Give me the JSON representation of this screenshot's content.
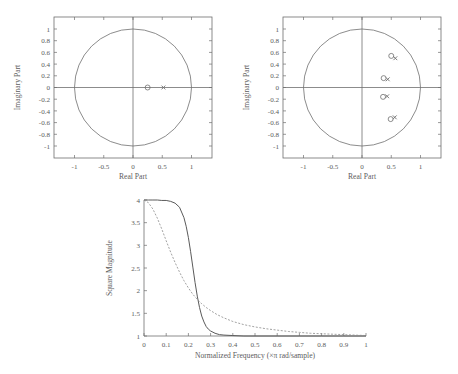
{
  "figure": {
    "background": "#ffffff",
    "ink_color": "#5d5d5d"
  },
  "panels": [
    {
      "id": "pole-zero-plot-1",
      "type": "pole-zero",
      "xlabel": "Real Part",
      "ylabel": "Imaginary Part",
      "xticks": [
        "-1",
        "-0.5",
        "0",
        "0.5",
        "1"
      ],
      "xtick_values": [
        -1,
        -0.5,
        0,
        0.5,
        1
      ],
      "yticks": [
        "1",
        "0.8",
        "0.6",
        "0.4",
        "0.2",
        "0",
        "-0.2",
        "-0.4",
        "-0.6",
        "-0.8",
        "-1"
      ],
      "ytick_values": [
        1,
        0.8,
        0.6,
        0.4,
        0.2,
        0,
        -0.2,
        -0.4,
        -0.6,
        -0.8,
        -1
      ],
      "xlim": [
        -1.35,
        1.35
      ],
      "ylim": [
        -1.12,
        1.12
      ],
      "unit_circle": true,
      "zeros": [
        [
          0.25,
          0.0
        ]
      ],
      "poles": [
        [
          0.52,
          0.0
        ]
      ]
    },
    {
      "id": "pole-zero-plot-2",
      "type": "pole-zero",
      "xlabel": "Real Part",
      "ylabel": "Imaginary Part",
      "xticks": [
        "-1",
        "-0.5",
        "0",
        "0.5",
        "1"
      ],
      "xtick_values": [
        -1,
        -0.5,
        0,
        0.5,
        1
      ],
      "yticks": [
        "1",
        "0.8",
        "0.6",
        "0.4",
        "0.2",
        "0",
        "-0.2",
        "-0.4",
        "-0.6",
        "-0.8",
        "-1"
      ],
      "ytick_values": [
        1,
        0.8,
        0.6,
        0.4,
        0.2,
        0,
        -0.2,
        -0.4,
        -0.6,
        -0.8,
        -1
      ],
      "xlim": [
        -1.35,
        1.35
      ],
      "ylim": [
        -1.12,
        1.12
      ],
      "unit_circle": true,
      "zeros": [
        [
          0.5,
          0.54
        ],
        [
          0.37,
          0.16
        ],
        [
          0.36,
          -0.16
        ],
        [
          0.49,
          -0.54
        ]
      ],
      "poles": [
        [
          0.57,
          0.5
        ],
        [
          0.44,
          0.14
        ],
        [
          0.43,
          -0.15
        ],
        [
          0.56,
          -0.51
        ]
      ]
    }
  ],
  "chart_data": {
    "type": "line",
    "title": "",
    "xlabel": "Normalized Frequency (×π rad/sample)",
    "ylabel": "Square Magnitude",
    "xlim": [
      0,
      1
    ],
    "ylim": [
      1,
      4
    ],
    "xticks": [
      "0",
      "0.1",
      "0.2",
      "0.3",
      "0.4",
      "0.5",
      "0.6",
      "0.7",
      "0.8",
      "0.9",
      "1"
    ],
    "xtick_values": [
      0,
      0.1,
      0.2,
      0.3,
      0.4,
      0.5,
      0.6,
      0.7,
      0.8,
      0.9,
      1
    ],
    "yticks": [
      "1",
      "1.5",
      "2",
      "2.5",
      "3",
      "3.5",
      "4"
    ],
    "ytick_values": [
      1,
      1.5,
      2,
      2.5,
      3,
      3.5,
      4
    ],
    "grid": false,
    "legend": "none",
    "series": [
      {
        "name": "high-order (solid)",
        "style": "solid",
        "x": [
          0.0,
          0.02,
          0.04,
          0.06,
          0.08,
          0.1,
          0.12,
          0.14,
          0.16,
          0.18,
          0.19,
          0.2,
          0.21,
          0.22,
          0.23,
          0.24,
          0.25,
          0.26,
          0.27,
          0.28,
          0.29,
          0.3,
          0.32,
          0.34,
          0.36,
          0.4,
          0.45,
          0.5,
          0.6,
          0.7,
          0.8,
          0.9,
          1.0
        ],
        "y": [
          4.0,
          4.0,
          4.0,
          4.0,
          3.99,
          3.99,
          3.97,
          3.93,
          3.84,
          3.61,
          3.42,
          3.17,
          2.86,
          2.52,
          2.18,
          1.88,
          1.63,
          1.44,
          1.31,
          1.21,
          1.15,
          1.11,
          1.06,
          1.03,
          1.02,
          1.01,
          1.0,
          1.0,
          1.0,
          1.0,
          1.0,
          1.0,
          1.0
        ]
      },
      {
        "name": "low-order (dashed)",
        "style": "dashed",
        "x": [
          0.0,
          0.02,
          0.04,
          0.06,
          0.08,
          0.1,
          0.12,
          0.14,
          0.16,
          0.18,
          0.2,
          0.22,
          0.24,
          0.25,
          0.26,
          0.28,
          0.3,
          0.33,
          0.36,
          0.4,
          0.45,
          0.5,
          0.55,
          0.6,
          0.65,
          0.7,
          0.75,
          0.8,
          0.85,
          0.9,
          0.95,
          1.0
        ],
        "y": [
          4.0,
          3.94,
          3.8,
          3.6,
          3.36,
          3.1,
          2.85,
          2.62,
          2.41,
          2.22,
          2.06,
          1.92,
          1.81,
          1.76,
          1.71,
          1.63,
          1.56,
          1.47,
          1.4,
          1.32,
          1.25,
          1.2,
          1.16,
          1.13,
          1.1,
          1.08,
          1.06,
          1.05,
          1.04,
          1.03,
          1.02,
          1.01
        ]
      }
    ]
  }
}
